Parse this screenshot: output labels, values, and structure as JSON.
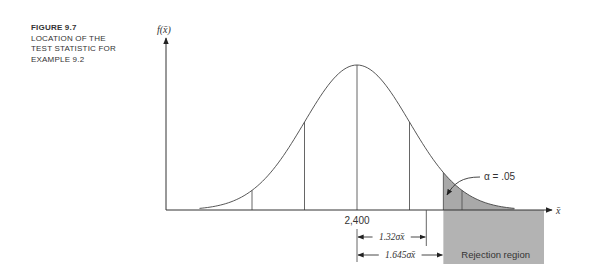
{
  "caption": {
    "figure": "FIGURE 9.7",
    "lines": [
      "LOCATION OF THE",
      "TEST STATISTIC FOR",
      "EXAMPLE 9.2"
    ]
  },
  "chart_data": {
    "type": "area",
    "title": "Location of the test statistic for Example 9.2",
    "xlabel": "x̄",
    "ylabel": "f(x̄)",
    "distribution": "normal",
    "mean_label": "2,400",
    "mean_z": 0,
    "x_range_z": [
      -3,
      3
    ],
    "sigma_lines_z": [
      -2,
      -1,
      0,
      1,
      2
    ],
    "test_statistic_z": 1.32,
    "critical_z": 1.645,
    "alpha_label": "α = .05",
    "rejection_region_label": "Rejection region",
    "dimension_labels": [
      {
        "text": "1.32σx̄",
        "z": 1.32
      },
      {
        "text": "1.645σx̄",
        "z": 1.645
      }
    ],
    "colors": {
      "shade": "#a9a9a9",
      "ink": "#333333",
      "region": "#b3b3b3"
    },
    "grid": false,
    "legend": "none"
  }
}
